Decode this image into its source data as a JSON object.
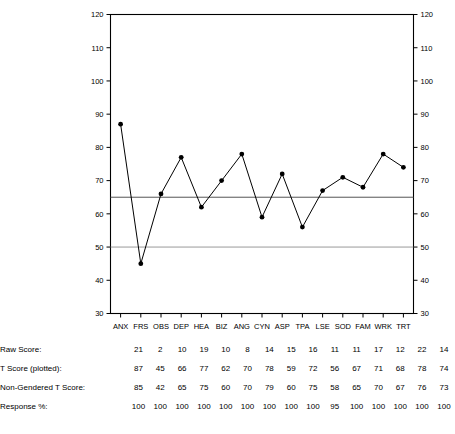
{
  "chart_data": {
    "type": "line",
    "title": "",
    "xlabel": "",
    "ylabel": "",
    "ylim": [
      30,
      120
    ],
    "yticks": [
      30,
      40,
      50,
      60,
      70,
      80,
      90,
      100,
      110,
      120
    ],
    "grid": false,
    "dual_y_axis": true,
    "legend": "none",
    "markers": "filled-circle",
    "reference_lines": [
      {
        "value": 65,
        "color": "#555555",
        "label": ""
      },
      {
        "value": 50,
        "color": "#999999",
        "label": ""
      }
    ],
    "categories": [
      "ANX",
      "FRS",
      "OBS",
      "DEP",
      "HEA",
      "BIZ",
      "ANG",
      "CYN",
      "ASP",
      "TPA",
      "LSE",
      "SOD",
      "FAM",
      "WRK",
      "TRT"
    ],
    "series": [
      {
        "name": "T Score (plotted)",
        "values": [
          87,
          45,
          66,
          77,
          62,
          70,
          78,
          59,
          72,
          56,
          67,
          71,
          68,
          78,
          74
        ]
      }
    ]
  },
  "table": {
    "rows": [
      {
        "label": "Raw Score:",
        "values": [
          21,
          2,
          10,
          19,
          10,
          8,
          14,
          15,
          16,
          11,
          11,
          17,
          12,
          22,
          14
        ]
      },
      {
        "label": "T Score (plotted):",
        "values": [
          87,
          45,
          66,
          77,
          62,
          70,
          78,
          59,
          72,
          56,
          67,
          71,
          68,
          78,
          74
        ]
      },
      {
        "label": "Non-Gendered T Score:",
        "values": [
          85,
          42,
          65,
          75,
          60,
          70,
          79,
          60,
          75,
          58,
          65,
          70,
          67,
          76,
          73
        ]
      },
      {
        "label": "Response %:",
        "values": [
          100,
          100,
          100,
          100,
          100,
          100,
          100,
          100,
          100,
          95,
          100,
          100,
          100,
          100,
          100
        ]
      }
    ]
  },
  "axis": {
    "left_ticks": [
      "120",
      "110",
      "100",
      "90",
      "80",
      "70",
      "60",
      "50",
      "40",
      "30"
    ],
    "right_ticks": [
      "120",
      "110",
      "100",
      "90",
      "80",
      "70",
      "60",
      "50",
      "40",
      "30"
    ]
  }
}
